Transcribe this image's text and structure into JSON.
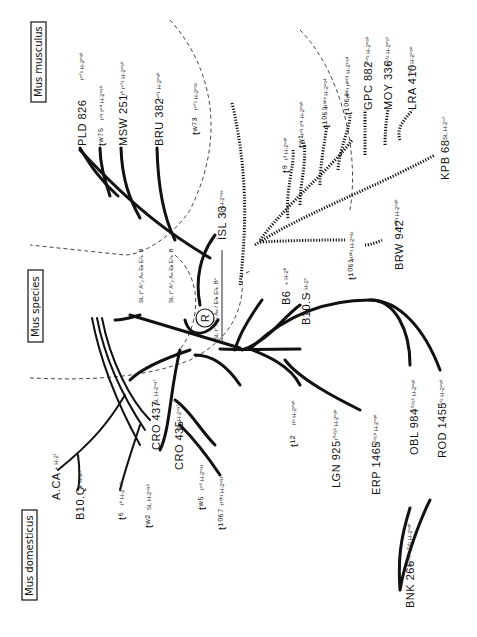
{
  "groups": {
    "musculus": "Mus musculus",
    "species": "Mus species",
    "domesticus": "Mus domesticus"
  },
  "root": {
    "symbol": "R",
    "genotype": "SL t° A°₂ Aₐ / E²ₕ E²ₖ B°"
  },
  "species_genotypes": [
    "SL t° A°₂ Aₐ Eₕ E²ₖ B",
    "SL t° A°₂ Aₐ Eₕ E²ₖ B"
  ],
  "musculus_taxa": [
    {
      "name": "PLD 826",
      "haplotype": "tʷ⁷³  H-2ʷ³⁰"
    },
    {
      "name": "tʷ⁷⁵",
      "haplotype": "tʷ¹ tʷ⁴ H-2ʷ³⁰"
    },
    {
      "name": "MSW 251",
      "haplotype": "t⁶ tʷ⁷¹ H-2ʷ³⁰"
    },
    {
      "name": "BRU 382",
      "haplotype": "tʷ⁷¹  H-2ʷ³⁰"
    },
    {
      "name": "tʷ⁷³",
      "haplotype": "tʷ⁷³  H-2ʷ³²"
    },
    {
      "name": "ISL 33",
      "haplotype": "R₁  H-2ʷ³³"
    }
  ],
  "hatched_taxa": [
    {
      "name": "t⁸",
      "haplotype": "t⁸  H-2ʷ³⁰"
    },
    {
      "name": "tʷ¹",
      "haplotype": "tʷ¹ tʷ¹  H-2ʷ³⁰"
    },
    {
      "name": "t¹⁰⁶⁹",
      "haplotype": "t¹⁰⁶⁹  H-2ʷ³⁴"
    },
    {
      "name": "t¹⁰⁶⁴",
      "haplotype": "t¹⁰⁶¹ t¹⁰⁶⁴  H-2ʷ³⁴"
    },
    {
      "name": "GPC 882",
      "haplotype": "tᵀᵘˡ²  H-2ʷ³⁰"
    },
    {
      "name": "MOY 336",
      "haplotype": "tᵀᵘˡ²  H-2ʷ³⁵"
    },
    {
      "name": "LRA 410",
      "haplotype": "tᵀᵘˡ²  H-2ʷ³⁰"
    },
    {
      "name": "KPB 68",
      "haplotype": "SL  H-2ʷ⁷"
    },
    {
      "name": "BRW 942",
      "haplotype": "t¹⁰⁶¹  H-2ʷ³⁰"
    },
    {
      "name": "t¹⁰⁶¹",
      "haplotype": "t¹⁰⁶¹  H-2ʷ³²"
    }
  ],
  "inbred": [
    {
      "name": "B6",
      "haplotype": "+ H-2ᵇ"
    },
    {
      "name": "B10.S",
      "haplotype": "+ H-2ˢ"
    }
  ],
  "domesticus_taxa": [
    {
      "name": "t¹²",
      "haplotype": "t¹²  H-2ʷ³⁰"
    },
    {
      "name": "LGN 925",
      "haplotype": "tᵀᵘˡ²⁶  H-2ʷ³⁰"
    },
    {
      "name": "ERP 1465",
      "haplotype": "tᵀᵘˡ²⁹  H-2ʷ³⁰"
    },
    {
      "name": "OBL 984",
      "haplotype": "tᵀᵘˡ²⁵  H-2ʷ³⁰"
    },
    {
      "name": "ROD 1455",
      "haplotype": "tᵀᵘˡ²  H-2ʷ³⁰"
    },
    {
      "name": "BNK 266",
      "haplotype": "tᵀᵘˡ²⁵ tᵀᵘˡ² H-2ʷ³⁰"
    },
    {
      "name": "CRO 437",
      "haplotype": "SL  H-2ʷ³⁷"
    },
    {
      "name": "CRO 435",
      "haplotype": "SL  H-2ʷ³⁷"
    },
    {
      "name": "tʷ⁵",
      "haplotype": "tʷ⁵  H-2ʷ³¹"
    },
    {
      "name": "t¹⁰⁶⁷",
      "haplotype": "t¹⁰⁶¹  H-2ʷ³¹"
    },
    {
      "name": "tʷ²",
      "haplotype": "SL  H-2ʷ³⁹"
    },
    {
      "name": "t⁶",
      "haplotype": "t⁶  H-2ʷ³⁹"
    },
    {
      "name": "B10.Q",
      "haplotype": "+ H-2ᵠ"
    },
    {
      "name": "A.CA",
      "haplotype": "+ H-2ᶠ"
    }
  ]
}
